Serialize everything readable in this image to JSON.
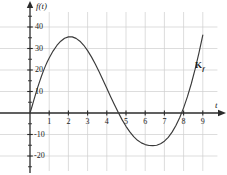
{
  "chart_data": {
    "type": "line",
    "title": "",
    "subtitle": "",
    "xlabel": "t",
    "ylabel": "f(t)",
    "xlim": [
      -0.6,
      9.8
    ],
    "ylim": [
      -26,
      45
    ],
    "grid": true,
    "legend_position": "inline-right",
    "x_ticks": [
      1,
      2,
      3,
      4,
      5,
      6,
      7,
      8,
      9
    ],
    "x_tick_labels": [
      "1",
      "2",
      "3",
      "4",
      "5",
      "6",
      "7",
      "8",
      "9"
    ],
    "y_ticks": [
      -20,
      -10,
      10,
      20,
      30,
      40
    ],
    "y_tick_labels": [
      "-20",
      "-10",
      "10",
      "20",
      "30",
      "40"
    ],
    "y_minor_ticks": [
      -25,
      -15,
      -5,
      5,
      15,
      25,
      35,
      45
    ],
    "x_gridlines": [
      1,
      2,
      3,
      4,
      5,
      6,
      7,
      8,
      9
    ],
    "y_gridlines": [
      -20,
      -10,
      10,
      20,
      30,
      40
    ],
    "annotations": [
      {
        "name": "curve-name",
        "text": "K",
        "subscript": "f",
        "x": 8.6,
        "y": 22
      }
    ],
    "series": [
      {
        "name": "f",
        "color": "#3a3a3a",
        "x": [
          0.0,
          0.1,
          0.2,
          0.3,
          0.4,
          0.5,
          0.6,
          0.7,
          0.8,
          0.9,
          1.0,
          1.2,
          1.4,
          1.6,
          1.8,
          2.0,
          2.2,
          2.4,
          2.6,
          2.8,
          3.0,
          3.2,
          3.4,
          3.6,
          3.8,
          4.0,
          4.2,
          4.4,
          4.6,
          4.8,
          5.0,
          5.2,
          5.4,
          5.6,
          5.8,
          6.0,
          6.2,
          6.4,
          6.6,
          6.8,
          7.0,
          7.2,
          7.4,
          7.6,
          7.8,
          8.0,
          8.2,
          8.4,
          8.6,
          8.8,
          9.0
        ],
        "y": [
          0.0,
          2.9,
          6.0,
          9.0,
          11.9,
          14.6,
          17.2,
          19.6,
          21.8,
          23.8,
          25.6,
          28.8,
          31.4,
          33.4,
          34.8,
          35.4,
          35.4,
          34.7,
          33.4,
          31.5,
          29.0,
          26.1,
          22.8,
          19.2,
          15.4,
          11.5,
          7.6,
          3.8,
          0.2,
          -3.2,
          -6.2,
          -8.8,
          -11.0,
          -12.7,
          -13.9,
          -14.7,
          -15.1,
          -15.2,
          -15.0,
          -14.3,
          -13.1,
          -11.3,
          -8.9,
          -5.8,
          -2.1,
          2.4,
          7.6,
          13.6,
          20.4,
          28.0,
          36.2
        ],
        "markers": {
          "max": {
            "x": 2.0,
            "y": 35.4
          },
          "min": {
            "x": 6.5,
            "y": -15.2
          },
          "zeros": [
            0.0,
            4.6,
            7.9
          ]
        }
      }
    ]
  },
  "axis": {
    "x_axis_arrow": true,
    "y_axis_arrow": true
  },
  "style": {
    "grid_color": "#cfcfcf",
    "axis_color": "#2b2b2b",
    "curve_color": "#3a3a3a",
    "text_color": "#1a1a1a",
    "background": "#ffffff"
  }
}
